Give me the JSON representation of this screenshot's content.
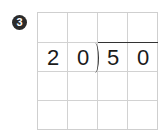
{
  "problem": {
    "number_badge": "3",
    "divisor": [
      "2",
      "0"
    ],
    "dividend": [
      "5",
      "0"
    ],
    "grid": {
      "rows": 4,
      "cols": 4
    },
    "line_color": "#d2d2d2",
    "text_color": "#1a1a1a"
  }
}
